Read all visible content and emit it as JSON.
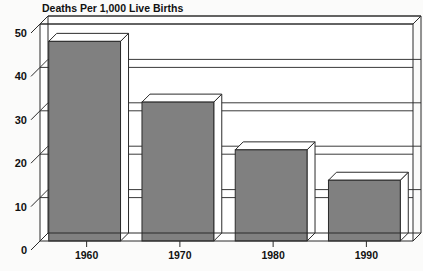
{
  "chart_data": {
    "type": "bar",
    "title": "Deaths Per 1,000 Live Births",
    "xlabel": "",
    "ylabel": "",
    "categories": [
      "1960",
      "1970",
      "1980",
      "1990"
    ],
    "values": [
      46,
      32,
      21,
      14
    ],
    "ylim": [
      0,
      50
    ],
    "yticks": [
      0,
      10,
      20,
      30,
      40,
      50
    ],
    "ytick_labels": [
      "0",
      "10",
      "20",
      "30",
      "40",
      "50"
    ],
    "grid": true,
    "grid_axis": "y",
    "legend": null,
    "legend_position": "none",
    "style": "3d-bar",
    "series": [
      {
        "name": "Deaths Per 1,000 Live Births",
        "values": [
          46,
          32,
          21,
          14
        ]
      }
    ],
    "colors": {
      "bar_front": "#808080",
      "bar_top": "#ffffff",
      "bar_side": "#ffffff",
      "outline": "#2b2b2b",
      "grid": "#3a3a3a",
      "axis": "#2b2b2b",
      "plot_background": "#ffffff",
      "page_background": "#fbfbfa",
      "text": "#111111"
    }
  }
}
